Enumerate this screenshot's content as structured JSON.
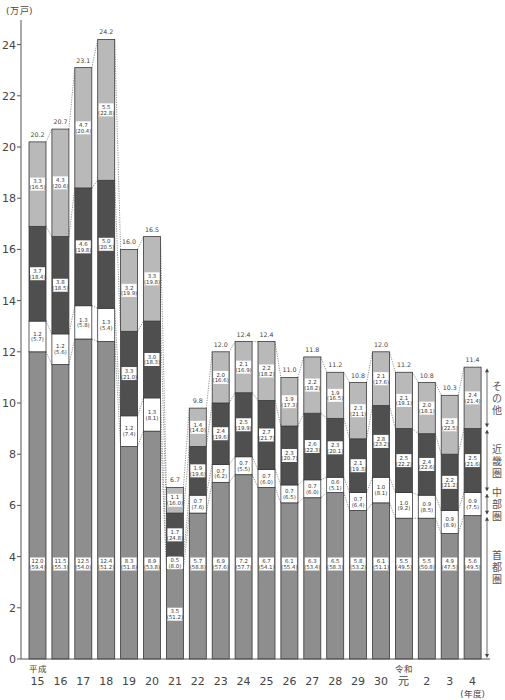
{
  "chart_data": {
    "type": "bar",
    "stacked": true,
    "title": "",
    "xlabel": "(年度)",
    "ylabel": "(万戸)",
    "ylim": [
      0,
      24
    ],
    "yticks": [
      0,
      2,
      4,
      6,
      8,
      10,
      12,
      14,
      16,
      18,
      20,
      22,
      24
    ],
    "grid": false,
    "legend_position": "right",
    "categories": [
      "15",
      "16",
      "17",
      "18",
      "19",
      "20",
      "21",
      "22",
      "23",
      "24",
      "25",
      "26",
      "27",
      "28",
      "29",
      "30",
      "元",
      "2",
      "3",
      "4"
    ],
    "era_labels": [
      {
        "index": 0,
        "text": "平成"
      },
      {
        "index": 16,
        "text": "令和"
      }
    ],
    "totals": [
      20.2,
      20.7,
      23.1,
      24.2,
      16.0,
      16.5,
      6.7,
      9.8,
      12.0,
      12.4,
      12.4,
      11.0,
      11.8,
      11.2,
      10.8,
      12.0,
      11.2,
      10.8,
      10.3,
      11.4
    ],
    "series": [
      {
        "name": "首都圏",
        "color": "#8e8e8e",
        "values": [
          12.0,
          11.5,
          12.5,
          12.4,
          8.3,
          8.9,
          3.5,
          5.7,
          6.9,
          7.2,
          6.7,
          6.1,
          6.3,
          6.5,
          5.8,
          6.1,
          5.5,
          5.5,
          4.9,
          5.6
        ],
        "shares": [
          59.4,
          55.3,
          54.0,
          51.2,
          51.8,
          53.8,
          51.2,
          58.8,
          57.6,
          57.7,
          54.1,
          55.4,
          53.4,
          58.3,
          53.2,
          51.1,
          49.5,
          50.8,
          47.5,
          49.5
        ]
      },
      {
        "name": "中部圏",
        "color": "#ffffff",
        "values": [
          1.2,
          1.2,
          1.3,
          1.3,
          1.2,
          1.3,
          0.5,
          0.7,
          0.7,
          0.7,
          0.7,
          0.7,
          0.7,
          0.6,
          0.7,
          1.0,
          1.0,
          0.9,
          0.9,
          0.9
        ],
        "shares": [
          5.7,
          5.6,
          5.8,
          5.4,
          7.4,
          8.1,
          8.0,
          7.6,
          6.2,
          5.5,
          6.0,
          6.5,
          6.0,
          5.1,
          6.4,
          8.1,
          9.2,
          8.5,
          8.9,
          7.5
        ]
      },
      {
        "name": "近畿圏",
        "color": "#4f4f4f",
        "values": [
          3.7,
          3.8,
          4.6,
          5.0,
          3.3,
          3.0,
          1.7,
          1.9,
          2.4,
          2.5,
          2.7,
          2.3,
          2.6,
          2.3,
          2.1,
          2.8,
          2.5,
          2.4,
          2.2,
          2.5
        ],
        "shares": [
          18.4,
          18.5,
          19.8,
          20.5,
          21.0,
          18.3,
          24.8,
          19.6,
          19.6,
          19.9,
          21.7,
          20.7,
          22.3,
          20.1,
          19.3,
          23.2,
          22.2,
          22.6,
          21.2,
          21.6
        ]
      },
      {
        "name": "その他",
        "color": "#b9b9b9",
        "values": [
          3.3,
          4.3,
          4.7,
          5.5,
          3.2,
          3.3,
          1.1,
          1.4,
          2.0,
          2.1,
          2.2,
          1.9,
          2.2,
          1.9,
          2.3,
          2.1,
          2.1,
          2.0,
          2.3,
          2.4
        ],
        "shares": [
          16.5,
          20.6,
          20.4,
          22.8,
          19.9,
          19.8,
          16.0,
          14.0,
          16.6,
          16.9,
          18.2,
          17.3,
          18.2,
          16.5,
          21.1,
          17.6,
          19.1,
          18.1,
          22.5,
          21.4
        ]
      }
    ]
  }
}
